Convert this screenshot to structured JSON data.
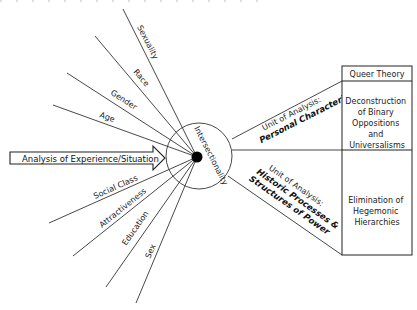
{
  "diagram": {
    "arrow_label": "Analysis of Experience/Situation",
    "center_label": "Intersectionality",
    "spokes": [
      {
        "label": "Sexuality",
        "x1": 123,
        "y1": 9
      },
      {
        "label": "Race",
        "x1": 95,
        "y1": 36
      },
      {
        "label": "Gender",
        "x1": 67,
        "y1": 73
      },
      {
        "label": "Age",
        "x1": 53,
        "y1": 105
      },
      {
        "label": "Social Class",
        "x1": 49,
        "y1": 223
      },
      {
        "label": "Attractiveness",
        "x1": 73,
        "y1": 256
      },
      {
        "label": "Education",
        "x1": 106,
        "y1": 287
      },
      {
        "label": "Sex",
        "x1": 136,
        "y1": 303
      }
    ],
    "units": [
      {
        "prefix": "Unit of Analysis:",
        "emphasis": "Personal Characteristics"
      },
      {
        "prefix": "Unit of Analysis:",
        "emphasis_line1": "Historic Processes &",
        "emphasis_line2": "Structures of Power"
      }
    ],
    "theory_box": {
      "header": "Queer Theory",
      "cells": [
        {
          "lines": [
            "Deconstruction",
            "of Binary",
            "Oppositions",
            "and",
            "Universalisms"
          ]
        },
        {
          "lines": [
            "Elimination of",
            "Hegemonic",
            "Hierarchies"
          ]
        }
      ]
    }
  }
}
